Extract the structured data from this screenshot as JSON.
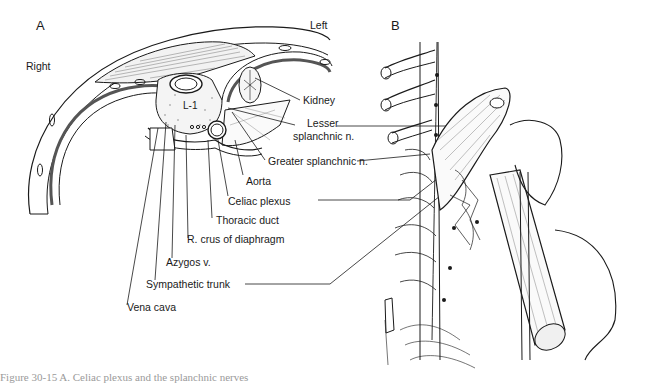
{
  "figure": {
    "panel_a": {
      "letter": "A",
      "orientation": {
        "right": "Right",
        "left": "Left"
      },
      "vertebra_label": "L-1",
      "labels": {
        "kidney": "Kidney",
        "lesser_splanchnic_1": "Lesser",
        "lesser_splanchnic_2": "splanchnic n.",
        "greater_splanchnic": "Greater splanchnic n.",
        "aorta": "Aorta",
        "celiac_plexus": "Celiac plexus",
        "thoracic_duct": "Thoracic duct",
        "r_crus": "R. crus of diaphragm",
        "azygos": "Azygos v.",
        "sympathetic_trunk": "Sympathetic trunk",
        "vena_cava": "Vena cava"
      }
    },
    "panel_b": {
      "letter": "B"
    },
    "caption": "Figure 30-15  A. Celiac plexus and the splanchnic nerves"
  }
}
